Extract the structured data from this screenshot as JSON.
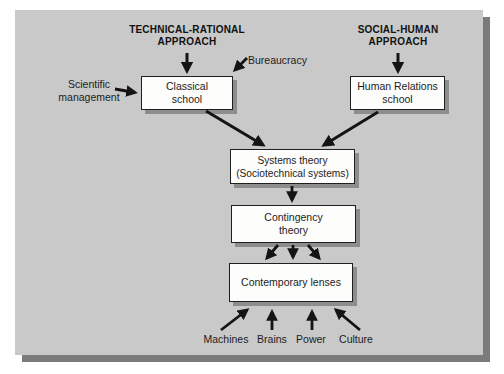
{
  "diagram": {
    "headings": {
      "technical_line1": "TECHNICAL-RATIONAL",
      "technical_line2": "APPROACH",
      "social_line1": "SOCIAL-HUMAN",
      "social_line2": "APPROACH"
    },
    "boxes": {
      "classical": {
        "line1": "Classical",
        "line2": "school"
      },
      "human_relations": {
        "line1": "Human Relations",
        "line2": "school"
      },
      "systems": {
        "line1": "Systems theory",
        "line2": "(Sociotechnical systems)"
      },
      "contingency": {
        "line1": "Contingency",
        "line2": "theory"
      },
      "contemporary": {
        "label": "Contemporary lenses"
      }
    },
    "side_labels": {
      "scientific_line1": "Scientific",
      "scientific_line2": "management",
      "bureaucracy": "Bureaucracy"
    },
    "bottom_labels": {
      "machines": "Machines",
      "brains": "Brains",
      "power": "Power",
      "culture": "Culture"
    }
  },
  "colors": {
    "page_background": "#ffffff",
    "panel_background": "#c9c9c9",
    "panel_shadow": "#7b7b7b",
    "box_fill": "#fdfdfc",
    "box_border": "#1f1f1f",
    "box_shadow": "#8d8d8d",
    "arrow": "#141414",
    "text": "#1c1c1c"
  }
}
